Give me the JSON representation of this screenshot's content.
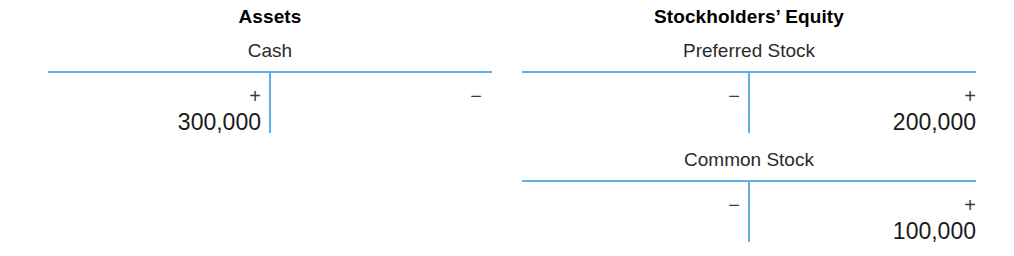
{
  "diagram": {
    "type": "t-account-ledger",
    "line_color": "#5fb0e8",
    "sections": [
      {
        "heading": "Assets",
        "accounts": [
          {
            "name": "Cash",
            "debit_sign": "+",
            "credit_sign": "−",
            "debit_amount": "300,000",
            "credit_amount": ""
          }
        ]
      },
      {
        "heading": "Stockholders’ Equity",
        "accounts": [
          {
            "name": "Preferred Stock",
            "debit_sign": "−",
            "credit_sign": "+",
            "debit_amount": "",
            "credit_amount": "200,000"
          },
          {
            "name": "Common Stock",
            "debit_sign": "−",
            "credit_sign": "+",
            "debit_amount": "",
            "credit_amount": "100,000"
          }
        ]
      }
    ]
  }
}
